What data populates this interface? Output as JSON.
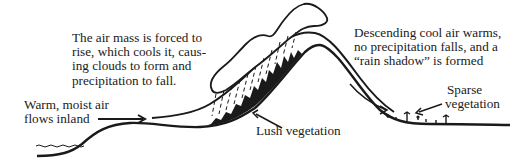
{
  "diagram": {
    "labels": {
      "rising_air": {
        "lines": [
          "The air mass is forced to",
          "rise, which cools it, caus-",
          "ing clouds to form and",
          "precipitation to fall."
        ]
      },
      "descending_air": {
        "lines": [
          "Descending cool air warms,",
          "no precipitation falls, and a",
          "“rain shadow” is formed"
        ]
      },
      "inflow": {
        "lines": [
          "Warm, moist air",
          "flows inland"
        ]
      },
      "lush": "Lush vegetation",
      "sparse": {
        "lines": [
          "Sparse",
          "vegetation"
        ]
      }
    },
    "colors": {
      "ink": "#1a1a1a",
      "background": "#ffffff"
    }
  }
}
